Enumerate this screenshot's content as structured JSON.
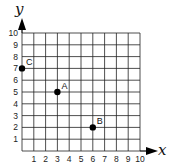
{
  "chart_data": {
    "type": "scatter",
    "title": "",
    "xlabel": "x",
    "ylabel": "y",
    "xlim": [
      0,
      10
    ],
    "ylim": [
      0,
      10
    ],
    "grid": true,
    "x_ticks": [
      "1",
      "2",
      "3",
      "4",
      "5",
      "6",
      "7",
      "8",
      "9",
      "10"
    ],
    "y_ticks": [
      "1",
      "2",
      "3",
      "4",
      "5",
      "6",
      "7",
      "8",
      "9",
      "10"
    ],
    "points": [
      {
        "label": "A",
        "x": 3,
        "y": 5
      },
      {
        "label": "B",
        "x": 6,
        "y": 2
      },
      {
        "label": "C",
        "x": 0,
        "y": 7
      }
    ],
    "legend": null
  },
  "colors": {
    "grid": "#222222",
    "point": "#000000",
    "background": "#ffffff"
  }
}
